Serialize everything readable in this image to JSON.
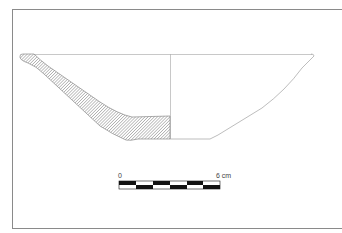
{
  "figure": {
    "type": "archaeological pottery profile drawing",
    "object": "bowl",
    "section_fill": "hatched",
    "colors": {
      "frame": "#8a8a8a",
      "outline": "#9a9a9a",
      "hatch": "#7a7a7a",
      "scale_black": "#111111",
      "scale_white": "#ffffff"
    }
  },
  "scale_bar": {
    "start_label": "0",
    "end_label": "6 cm",
    "segments": 6,
    "unit": "cm"
  }
}
